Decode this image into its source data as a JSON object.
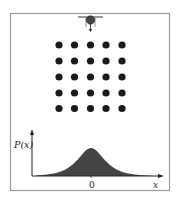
{
  "diagram": {
    "type": "galton-board-probability",
    "source": {
      "shape": "funnel-with-ball",
      "arrow": "down"
    },
    "peg_grid": {
      "rows": 5,
      "cols": 5
    },
    "distribution": {
      "shape": "bell-curve",
      "fill": "#444444"
    },
    "axes": {
      "ylabel": "P(x)",
      "xlabel": "x",
      "xtick": "0"
    }
  },
  "colors": {
    "frame": "#999999",
    "peg": "#1a1a1a",
    "curve_fill": "#444444",
    "axis": "#222222"
  }
}
